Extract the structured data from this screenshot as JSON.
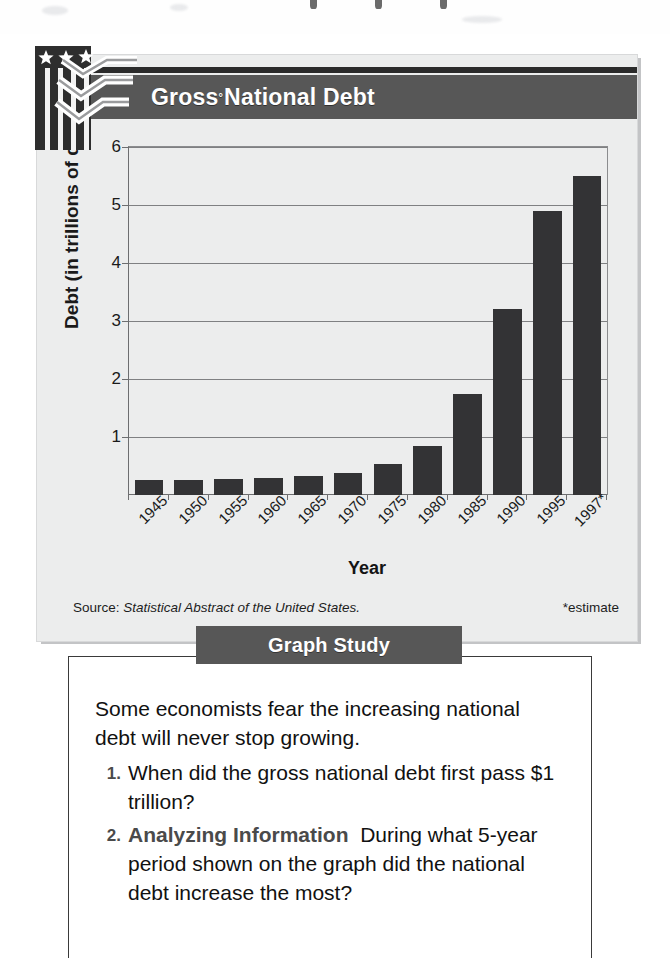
{
  "figure": {
    "title": "Gross National Debt",
    "title_superscript": "°",
    "logo_icon": "us-flag-chevron-logo"
  },
  "chart_data": {
    "type": "bar",
    "title": "Gross National Debt",
    "xlabel": "Year",
    "ylabel": "Debt (in trillions of dollars)",
    "ylim": [
      0,
      6
    ],
    "yticks": [
      1,
      2,
      3,
      4,
      5,
      6
    ],
    "grid": true,
    "legend": null,
    "categories": [
      "1945",
      "1950",
      "1955",
      "1960",
      "1965",
      "1970",
      "1975",
      "1980",
      "1985",
      "1990",
      "1995",
      "1997*"
    ],
    "values": [
      0.26,
      0.26,
      0.27,
      0.29,
      0.32,
      0.38,
      0.54,
      0.85,
      1.75,
      3.2,
      4.9,
      5.5
    ],
    "bar_color": "#333335",
    "annotations": [
      "*estimate"
    ]
  },
  "source": {
    "label": "Source: ",
    "publication": "Statistical Abstract of the United States.",
    "estimate_note": "*estimate"
  },
  "study": {
    "tab_label": "Graph Study",
    "intro": "Some economists fear the increasing national debt will never stop growing.",
    "questions": [
      {
        "number": "1.",
        "strong": "",
        "text": "When did the gross national debt first pass $1 trillion?"
      },
      {
        "number": "2.",
        "strong": "Analyzing Information",
        "text": "During what 5-year period shown on the graph did the national debt increase the most?"
      }
    ]
  },
  "colors": {
    "header_gray": "#575757",
    "bar_dark": "#333335",
    "panel_bg": "#eceded",
    "rule_dark": "#2b2b2b"
  }
}
